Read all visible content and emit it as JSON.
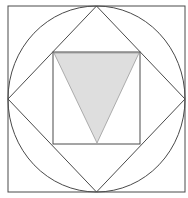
{
  "figure": {
    "colors": {
      "background": "#ffffff",
      "stroke": "#4a4a4a",
      "triangle_fill": "#dedede"
    },
    "shapes": {
      "outer_square": {
        "x": 8,
        "y": 6,
        "width": 177,
        "height": 186
      },
      "circle": {
        "cx": 96.5,
        "cy": 99,
        "rx": 88.5,
        "ry": 93
      },
      "diamond": {
        "points": "96.5,6 185,99 96.5,192 8,99"
      },
      "inner_square": {
        "x": 53,
        "y": 52,
        "width": 87,
        "height": 92
      },
      "shaded_triangle": {
        "points": "54,53 139,53 97,143"
      }
    }
  }
}
